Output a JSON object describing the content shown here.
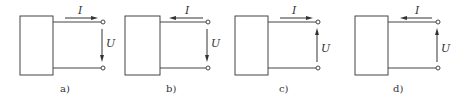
{
  "figure": {
    "panels": [
      {
        "id": "a",
        "caption": "a)",
        "current_label": "I",
        "voltage_label": "U",
        "current_direction": "right",
        "voltage_direction": "down",
        "box_x": 20,
        "term_x": 103,
        "cap_x": 60
      },
      {
        "id": "b",
        "caption": "b)",
        "current_label": "I",
        "voltage_label": "U",
        "current_direction": "left",
        "voltage_direction": "down",
        "box_x": 125,
        "term_x": 208,
        "cap_x": 166
      },
      {
        "id": "c",
        "caption": "c)",
        "current_label": "I",
        "voltage_label": "U",
        "current_direction": "right",
        "voltage_direction": "up",
        "box_x": 235,
        "term_x": 318,
        "cap_x": 279
      },
      {
        "id": "d",
        "caption": "d)",
        "current_label": "I",
        "voltage_label": "U",
        "current_direction": "left",
        "voltage_direction": "up",
        "box_x": 355,
        "term_x": 438,
        "cap_x": 393
      }
    ],
    "colors": {
      "line": "#444444",
      "text": "#333333",
      "background": "#ffffff"
    }
  }
}
